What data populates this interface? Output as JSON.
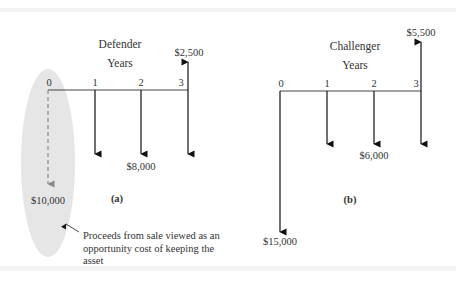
{
  "defender": {
    "title": "Defender",
    "axis_label": "Years",
    "ticks": [
      "0",
      "1",
      "2",
      "3"
    ],
    "caption": "(a)",
    "cash_flows": [
      {
        "year": 0,
        "amount": -10000,
        "label": "$10,000",
        "style": "dashed-opportunity-cost"
      },
      {
        "year": 1,
        "amount": -8000,
        "label": ""
      },
      {
        "year": 2,
        "amount": -8000,
        "label": "$8,000"
      },
      {
        "year": 3,
        "amount": -8000,
        "label": ""
      },
      {
        "year": 3,
        "amount": 2500,
        "label": "$2,500"
      }
    ],
    "annotation": "Proceeds from sale viewed as an opportunity cost of keeping the asset"
  },
  "challenger": {
    "title": "Challenger",
    "axis_label": "Years",
    "ticks": [
      "0",
      "1",
      "2",
      "3"
    ],
    "caption": "(b)",
    "cash_flows": [
      {
        "year": 0,
        "amount": -15000,
        "label": "$15,000"
      },
      {
        "year": 1,
        "amount": -6000,
        "label": ""
      },
      {
        "year": 2,
        "amount": -6000,
        "label": "$6,000"
      },
      {
        "year": 3,
        "amount": -6000,
        "label": ""
      },
      {
        "year": 3,
        "amount": 5500,
        "label": "$5,500"
      }
    ]
  },
  "colors": {
    "arrow": "#111111",
    "dashed_arrow": "#888888",
    "highlight_ellipse": "#e6e6e6"
  }
}
